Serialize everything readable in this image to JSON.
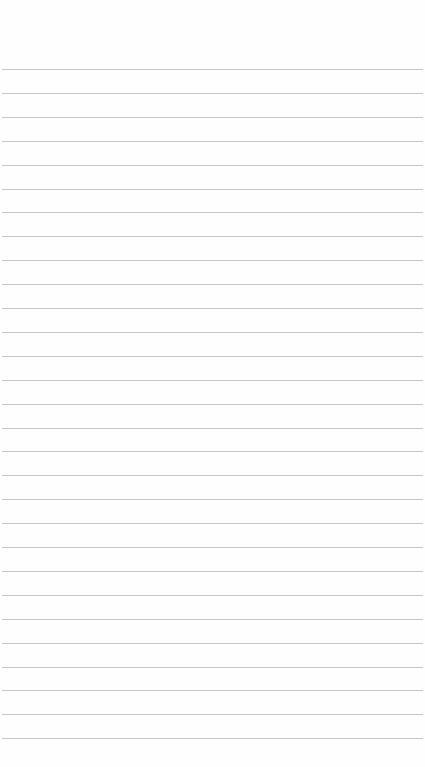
{
  "page": {
    "type": "ruled-paper",
    "background_color": "#fefefe",
    "line_color": "#c6c6c6",
    "first_line_y": 69,
    "line_spacing": 23.9,
    "line_count": 29
  }
}
